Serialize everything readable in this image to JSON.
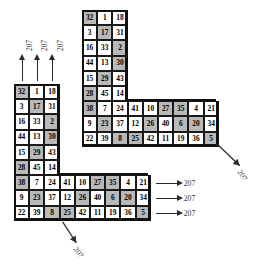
{
  "figure": {
    "magic_constant": "207",
    "arrow_label": "207",
    "colors": {
      "grid_line": "#1a1a1a",
      "outline": "#111111",
      "shade_band": "#b9b9b9",
      "cell_background": "#ffffff",
      "label_text": "#333333",
      "page_background": "#ffffff"
    }
  },
  "shapes": [
    {
      "name": "top-right-L",
      "vertical_rows": [
        [
          32,
          1,
          18
        ],
        [
          3,
          17,
          31
        ],
        [
          16,
          33,
          2
        ],
        [
          44,
          13,
          30
        ],
        [
          15,
          29,
          43
        ],
        [
          28,
          45,
          14
        ]
      ],
      "horizontal_rows": [
        [
          38,
          7,
          24,
          41,
          10,
          27,
          35,
          4,
          21
        ],
        [
          9,
          23,
          37,
          12,
          26,
          40,
          6,
          20,
          34
        ],
        [
          22,
          39,
          8,
          25,
          42,
          11,
          19,
          36,
          5
        ]
      ],
      "shaded_cells_vertical": [
        [
          0,
          0
        ],
        [
          1,
          1
        ],
        [
          2,
          2
        ],
        [
          3,
          2
        ],
        [
          4,
          1
        ],
        [
          5,
          0
        ]
      ],
      "shaded_cells_horizontal": [
        [
          0,
          0
        ],
        [
          1,
          1
        ],
        [
          2,
          2
        ],
        [
          0,
          5
        ],
        [
          1,
          6
        ],
        [
          1,
          4
        ],
        [
          2,
          3
        ],
        [
          0,
          6
        ],
        [
          1,
          7
        ],
        [
          2,
          8
        ]
      ],
      "arrows": [
        {
          "id": "top-right-diagonal",
          "direction": "down-right",
          "label": "207"
        }
      ]
    },
    {
      "name": "bottom-left-L",
      "vertical_rows": [
        [
          32,
          1,
          18
        ],
        [
          3,
          17,
          31
        ],
        [
          16,
          33,
          2
        ],
        [
          44,
          13,
          30
        ],
        [
          15,
          29,
          43
        ],
        [
          28,
          45,
          14
        ]
      ],
      "horizontal_rows": [
        [
          38,
          7,
          24,
          41,
          10,
          27,
          35,
          4,
          21
        ],
        [
          9,
          23,
          37,
          12,
          26,
          40,
          6,
          20,
          34
        ],
        [
          22,
          39,
          8,
          25,
          42,
          11,
          19,
          36,
          5
        ]
      ],
      "shaded_cells_vertical": [
        [
          0,
          0
        ],
        [
          1,
          1
        ],
        [
          2,
          2
        ],
        [
          3,
          2
        ],
        [
          4,
          1
        ],
        [
          5,
          0
        ]
      ],
      "shaded_cells_horizontal": [
        [
          0,
          0
        ],
        [
          1,
          1
        ],
        [
          2,
          2
        ],
        [
          0,
          5
        ],
        [
          1,
          6
        ],
        [
          1,
          4
        ],
        [
          2,
          3
        ],
        [
          0,
          6
        ],
        [
          1,
          7
        ],
        [
          2,
          8
        ]
      ],
      "arrows": [
        {
          "id": "column-sum-1",
          "direction": "up",
          "label": "207"
        },
        {
          "id": "column-sum-2",
          "direction": "up",
          "label": "207"
        },
        {
          "id": "column-sum-3",
          "direction": "up",
          "label": "207"
        },
        {
          "id": "row-sum-1",
          "direction": "right",
          "label": "207"
        },
        {
          "id": "row-sum-2",
          "direction": "right",
          "label": "207"
        },
        {
          "id": "row-sum-3",
          "direction": "right",
          "label": "207"
        },
        {
          "id": "bottom-left-diagonal",
          "direction": "down-right",
          "label": "207"
        }
      ]
    }
  ],
  "labels": {
    "up_arrows": [
      "207",
      "207",
      "207"
    ],
    "right_arrows": [
      "207",
      "207",
      "207"
    ],
    "diagonal_bottom": "207",
    "diagonal_top": "207"
  }
}
